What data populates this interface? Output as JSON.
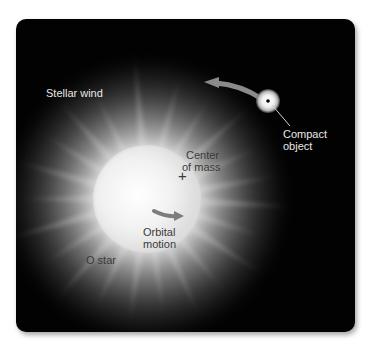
{
  "figure": {
    "background_color": "#020202",
    "labels": {
      "stellar_wind": "Stellar wind",
      "compact_object_line1": "Compact",
      "compact_object_line2": "object",
      "center_of_mass_line1": "Center",
      "center_of_mass_line2": "of mass",
      "orbital_motion_line1": "Orbital",
      "orbital_motion_line2": "motion",
      "o_star": "O star"
    },
    "center_of_mass_marker": "+",
    "colors": {
      "star_core": "#ffffff",
      "star_glow": "#d8d8d8",
      "arrow": "#8a8a8a",
      "label_light": "#e8e8e8",
      "label_dark": "#3a3a3a"
    }
  }
}
